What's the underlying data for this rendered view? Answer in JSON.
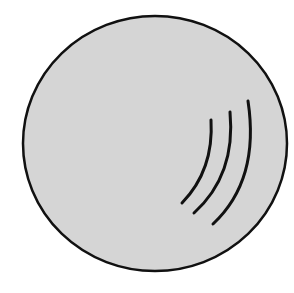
{
  "figure": {
    "background_color": "#ffffff",
    "disc": {
      "cx": 155,
      "cy": 143.5,
      "rx": 132,
      "ry": 127.5,
      "fill": "#d5d5d5",
      "stroke": "#111111",
      "stroke_width": 2.5
    },
    "arcs": [
      {
        "d": "M 211 120 Q 214 170 182 203",
        "stroke": "#111111",
        "stroke_width": 3
      },
      {
        "d": "M 230 112 Q 236 175 194 213",
        "stroke": "#111111",
        "stroke_width": 3
      },
      {
        "d": "M 248 101 Q 260 180 213 224",
        "stroke": "#111111",
        "stroke_width": 3
      }
    ]
  }
}
